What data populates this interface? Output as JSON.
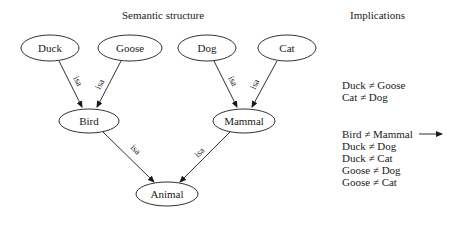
{
  "titles": {
    "structure": "Semantic structure",
    "implications": "Implications"
  },
  "nodes": {
    "duck": "Duck",
    "goose": "Goose",
    "dog": "Dog",
    "cat": "Cat",
    "bird": "Bird",
    "mammal": "Mammal",
    "animal": "Animal"
  },
  "edges": [
    {
      "from": "Duck",
      "to": "Bird",
      "label": "isa"
    },
    {
      "from": "Goose",
      "to": "Bird",
      "label": "isa"
    },
    {
      "from": "Dog",
      "to": "Mammal",
      "label": "isa"
    },
    {
      "from": "Cat",
      "to": "Mammal",
      "label": "isa"
    },
    {
      "from": "Bird",
      "to": "Animal",
      "label": "isa"
    },
    {
      "from": "Mammal",
      "to": "Animal",
      "label": "isa"
    }
  ],
  "implications": {
    "group1": [
      "Duck ≠ Goose",
      "Cat ≠ Dog"
    ],
    "group2": [
      "Bird ≠ Mammal",
      "Duck ≠ Dog",
      "Duck ≠ Cat",
      "Goose ≠ Dog",
      "Goose ≠ Cat"
    ]
  }
}
